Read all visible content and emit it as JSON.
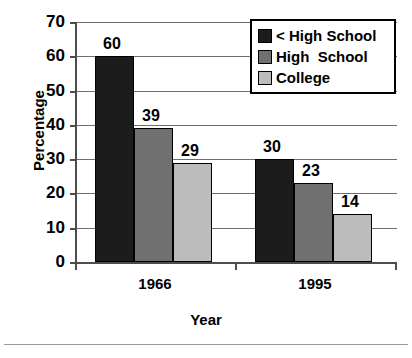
{
  "chart_data": {
    "type": "bar",
    "title": "",
    "xlabel": "Year",
    "ylabel": "Percentage",
    "categories": [
      "1966",
      "1995"
    ],
    "series": [
      {
        "name": "< High School",
        "color": "#1c1c1c",
        "values": [
          60,
          30
        ]
      },
      {
        "name": "High  School",
        "color": "#707070",
        "values": [
          39,
          23
        ]
      },
      {
        "name": "College",
        "color": "#bcbcbc",
        "values": [
          29,
          14
        ]
      }
    ],
    "data_labels": [
      [
        "60",
        "39",
        "29"
      ],
      [
        "30",
        "23",
        "14"
      ]
    ],
    "ylim": [
      0,
      70
    ],
    "ytick_labels": [
      "0",
      "10",
      "20",
      "30",
      "40",
      "50",
      "60",
      "70"
    ],
    "ytick_values": [
      0,
      10,
      20,
      30,
      40,
      50,
      60,
      70
    ],
    "grid": true,
    "legend_position": "top-right"
  },
  "legend": {
    "items": [
      {
        "label": "< High School"
      },
      {
        "label": "High  School"
      },
      {
        "label": "College"
      }
    ]
  }
}
